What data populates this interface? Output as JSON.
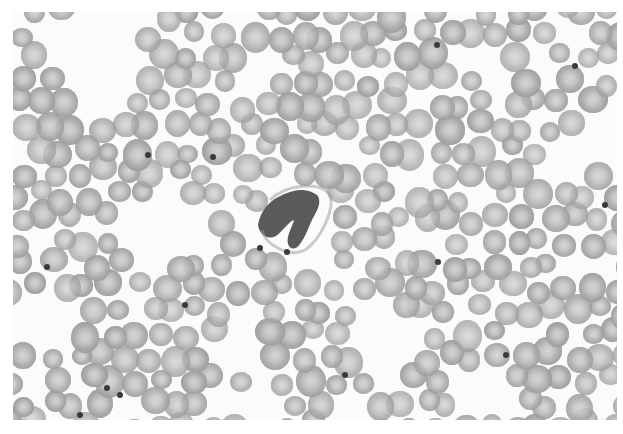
{
  "image": {
    "description": "Grayscale light micrograph of a peripheral blood smear showing numerous red blood cells, scattered platelets, and a single central darkly stained leukocyte with irregular lobed nucleus",
    "frame": {
      "left": 13,
      "top": 12,
      "width": 604,
      "height": 408
    },
    "colors": {
      "background": "#fbfbfb",
      "rbc": "#a9a9a9",
      "rbc_center": "#d4d4d4",
      "platelet": "#3a3a3a",
      "wbc_nucleus": "#3d3d3d"
    }
  },
  "leukocyte": {
    "cx": 300,
    "cy": 228,
    "label": "central white blood cell"
  },
  "platelets": [
    [
      437,
      45
    ],
    [
      575,
      66
    ],
    [
      213,
      157
    ],
    [
      148,
      155
    ],
    [
      47,
      267
    ],
    [
      438,
      262
    ],
    [
      185,
      305
    ],
    [
      107,
      388
    ],
    [
      80,
      415
    ],
    [
      605,
      205
    ],
    [
      260,
      248
    ],
    [
      287,
      252
    ],
    [
      120,
      395
    ],
    [
      345,
      375
    ],
    [
      506,
      355
    ]
  ],
  "cell_field": {
    "cell_size_range": [
      20,
      30
    ],
    "seed": 7
  }
}
